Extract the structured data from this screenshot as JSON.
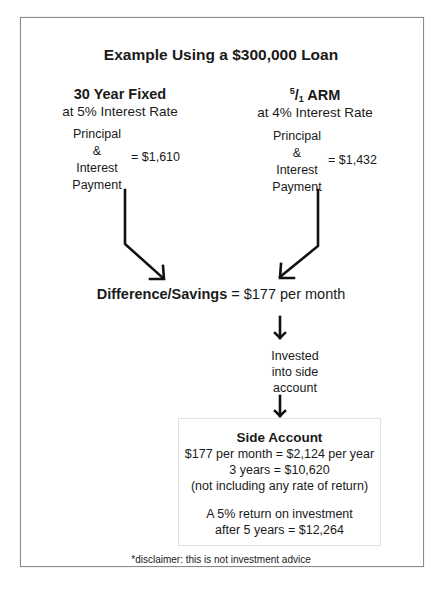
{
  "header_fragment": "... this same effect.",
  "diagram": {
    "title": "Example Using a $300,000 Loan",
    "left_loan": {
      "heading": "30 Year Fixed",
      "rate_text": "at 5% Interest Rate",
      "payment_label_lines": [
        "Principal",
        "&",
        "Interest",
        "Payment"
      ],
      "payment_value": "= $1,610"
    },
    "right_loan": {
      "heading_sup": "5",
      "heading_sep": "/",
      "heading_sub": "1",
      "heading_rest": " ARM",
      "rate_text": "at 4% Interest Rate",
      "payment_label_lines": [
        "Principal",
        "&",
        "Interest",
        "Payment"
      ],
      "payment_value": "= $1,432"
    },
    "difference": {
      "label": "Difference/Savings",
      "value": " = $177 per month"
    },
    "invested_lines": [
      "Invested",
      "into side",
      "account"
    ],
    "side_account": {
      "title": "Side Account",
      "lines": [
        "$177 per month = $2,124 per year",
        "3 years = $10,620",
        "(not including any rate of return)"
      ],
      "return_lines": [
        "A 5% return on investment",
        "after 5 years = $12,264"
      ]
    },
    "disclaimer": "*disclaimer: this is not investment advice"
  },
  "colors": {
    "text": "#1a1a1a",
    "frame_border": "#8a8a8a",
    "box_border": "#e2e2e2",
    "arrow": "#111111"
  }
}
